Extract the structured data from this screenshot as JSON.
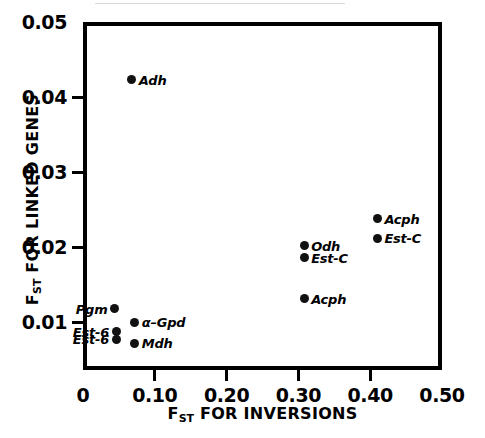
{
  "chart_data": {
    "type": "scatter",
    "title": "",
    "xlabel": "F_ST FOR INVERSIONS",
    "ylabel": "F_ST FOR LINKED GENES",
    "xlabel_main": "FOR INVERSIONS",
    "ylabel_main": "FOR LINKED GENES",
    "axis_symbol": "F",
    "axis_subscript": "ST",
    "xlim": [
      0,
      0.5
    ],
    "ylim": [
      0.0036,
      0.05
    ],
    "xticks": [
      0,
      0.1,
      0.2,
      0.3,
      0.4,
      0.5
    ],
    "xtick_labels": [
      "0",
      "0.10",
      "0.20",
      "0.30",
      "0.40",
      "0.50"
    ],
    "yticks": [
      0.01,
      0.02,
      0.03,
      0.04,
      0.05
    ],
    "ytick_labels": [
      "0.01",
      "0.02",
      "0.03",
      "0.04",
      "0.05"
    ],
    "grid": false,
    "legend": false,
    "marker_color": "#111111",
    "axis_color": "#000000",
    "points": [
      {
        "label": "Adh",
        "x": 0.068,
        "y": 0.0423,
        "label_side": "right"
      },
      {
        "label": "Acph",
        "x": 0.41,
        "y": 0.0238,
        "label_side": "right"
      },
      {
        "label": "Est-C",
        "x": 0.41,
        "y": 0.0212,
        "label_side": "right"
      },
      {
        "label": "Odh",
        "x": 0.308,
        "y": 0.0202,
        "label_side": "right"
      },
      {
        "label": "Est-C",
        "x": 0.308,
        "y": 0.0186,
        "label_side": "right"
      },
      {
        "label": "Acph",
        "x": 0.308,
        "y": 0.0131,
        "label_side": "right"
      },
      {
        "label": "Pgm",
        "x": 0.044,
        "y": 0.0118,
        "label_side": "left"
      },
      {
        "label": "α–Gpd",
        "x": 0.072,
        "y": 0.01,
        "label_side": "right"
      },
      {
        "label": "Est-6",
        "x": 0.046,
        "y": 0.0087,
        "label_side": "left"
      },
      {
        "label": "Est-6",
        "x": 0.046,
        "y": 0.0077,
        "label_side": "left"
      },
      {
        "label": "Mdh",
        "x": 0.072,
        "y": 0.0072,
        "label_side": "right"
      }
    ]
  }
}
